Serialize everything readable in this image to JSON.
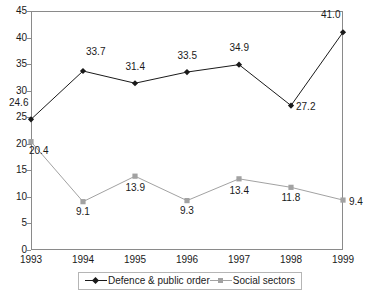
{
  "chart_data": {
    "type": "line",
    "title": "",
    "subtitle": "",
    "xlabel": "",
    "ylabel": "",
    "categories": [
      "1993",
      "1994",
      "1995",
      "1996",
      "1997",
      "1998",
      "1999"
    ],
    "ylim": [
      0,
      45
    ],
    "yticks": [
      "45",
      "40",
      "35",
      "30",
      "25",
      "20",
      "15",
      "10",
      "5",
      "0"
    ],
    "ytick_values": [
      45,
      40,
      35,
      30,
      25,
      20,
      15,
      10,
      5,
      0
    ],
    "grid": false,
    "legend_position": "bottom",
    "series": [
      {
        "name": "Defence & public order",
        "color": "#1a1a1a",
        "marker": "diamond",
        "values": [
          24.6,
          33.7,
          31.4,
          33.5,
          34.9,
          27.2,
          41.0
        ],
        "labels": [
          "24.6",
          "33.7",
          "31.4",
          "33.5",
          "34.9",
          "27.2",
          "41.0"
        ]
      },
      {
        "name": "Social sectors",
        "color": "#a2a2a2",
        "marker": "square",
        "values": [
          20.4,
          9.1,
          13.9,
          9.3,
          13.4,
          11.8,
          9.4
        ],
        "labels": [
          "20.4",
          "9.1",
          "13.9",
          "9.3",
          "13.4",
          "11.8",
          "9.4"
        ]
      }
    ]
  },
  "legend": {
    "items": [
      {
        "label": "Defence & public order"
      },
      {
        "label": "Social sectors"
      }
    ]
  }
}
